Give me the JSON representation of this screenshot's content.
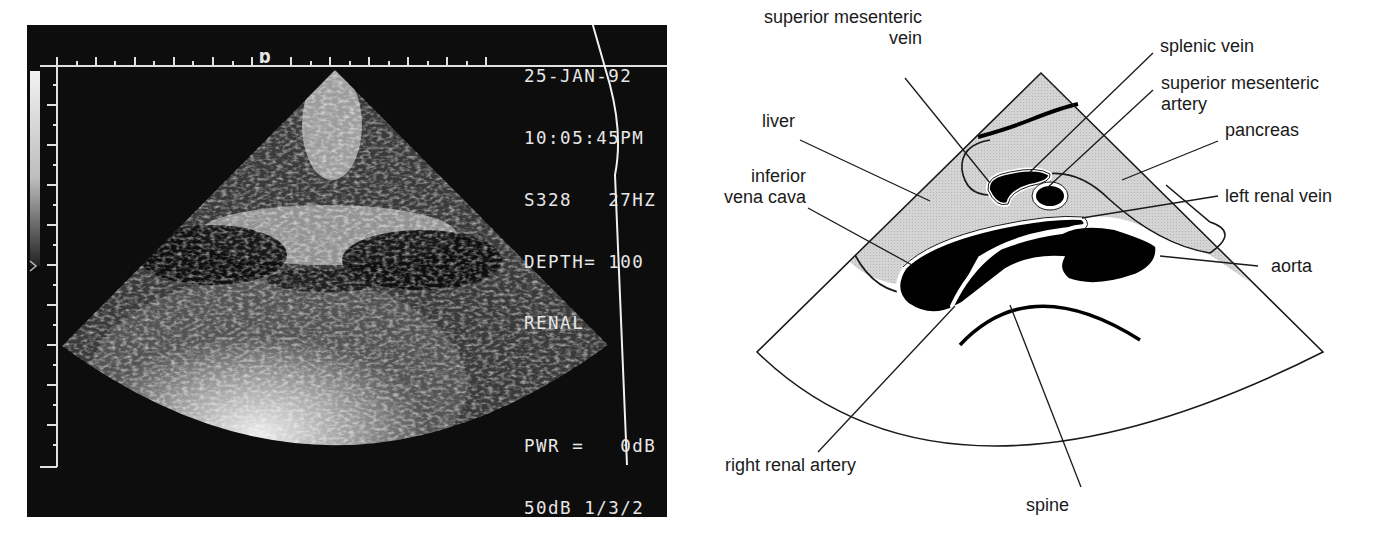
{
  "ultrasound": {
    "marker_glyph": "a",
    "readout": {
      "date": "25-JAN-92",
      "time": "10:05:45PM",
      "probe_freq": "S328   27HZ",
      "depth": "DEPTH= 100",
      "preset": "RENAL",
      "power": "PWR =   0dB",
      "dynamic_range": "50dB 1/3/2",
      "gain": "GAIN= -1dB"
    }
  },
  "diagram": {
    "labels": {
      "superior_mesenteric_vein_1": "superior mesenteric",
      "superior_mesenteric_vein_2": "vein",
      "liver": "liver",
      "inferior_vena_cava_1": "inferior",
      "inferior_vena_cava_2": "vena cava",
      "splenic_vein": "splenic vein",
      "superior_mesenteric_artery_1": "superior mesenteric",
      "superior_mesenteric_artery_2": "artery",
      "pancreas": "pancreas",
      "left_renal_vein": "left renal vein",
      "aorta": "aorta",
      "right_renal_artery": "right renal artery",
      "spine": "spine"
    },
    "colors": {
      "shaded_tissue": "#d3d3d3",
      "vessel_fill": "#000000",
      "outline": "#1a1a1a"
    }
  }
}
